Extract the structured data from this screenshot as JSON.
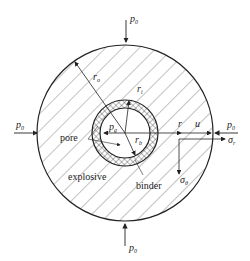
{
  "diagram": {
    "labels": {
      "p0_top": "p",
      "p0_bottom": "p",
      "p0_left": "p",
      "p0_right": "p",
      "p0_sub": "0",
      "ro": "r",
      "ro_sub": "o",
      "ri": "r",
      "ri_sub": "i",
      "pg": "p",
      "pg_sub": "g",
      "rb": "r",
      "rb_sub": "b",
      "r": "r",
      "u": "u",
      "sigma_r": "σ",
      "sigma_r_sub": "r",
      "sigma_theta": "σ",
      "sigma_theta_sub": "θ",
      "pore": "pore",
      "explosive": "explosive",
      "binder": "binder"
    },
    "colors": {
      "stroke": "#222222",
      "hatch": "#555555",
      "background": "#ffffff"
    }
  }
}
